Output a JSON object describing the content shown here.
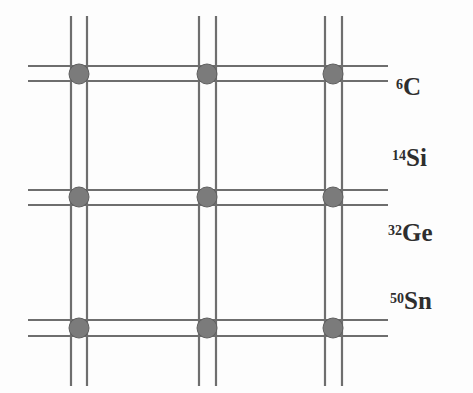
{
  "figure": {
    "background_color": "#fdfdfd"
  },
  "diagram": {
    "type": "lattice-grid",
    "line_color": "#6e6e6e",
    "line_width": 2.2,
    "node_color": "#7b7b7b",
    "node_stroke_color": "#5f5f5f",
    "node_radius": 10,
    "vertical_line_pairs": [
      {
        "name": "column-1",
        "x1": 71,
        "x2": 87
      },
      {
        "name": "column-2",
        "x1": 199,
        "x2": 216
      },
      {
        "name": "column-3",
        "x1": 325,
        "x2": 342
      }
    ],
    "vertical_extent": {
      "y_start": 16,
      "y_end": 386
    },
    "horizontal_line_pairs": [
      {
        "name": "row-1",
        "y1": 66,
        "y2": 81
      },
      {
        "name": "row-2",
        "y1": 190,
        "y2": 205
      },
      {
        "name": "row-3",
        "y1": 320,
        "y2": 336
      }
    ],
    "horizontal_extent": {
      "x_start": 28,
      "x_end": 388
    },
    "nodes": [
      {
        "name": "node-r1c1",
        "cx": 79,
        "cy": 74
      },
      {
        "name": "node-r1c2",
        "cx": 207,
        "cy": 74
      },
      {
        "name": "node-r1c3",
        "cx": 333,
        "cy": 74
      },
      {
        "name": "node-r2c1",
        "cx": 79,
        "cy": 197
      },
      {
        "name": "node-r2c2",
        "cx": 207,
        "cy": 197
      },
      {
        "name": "node-r2c3",
        "cx": 333,
        "cy": 197
      },
      {
        "name": "node-r3c1",
        "cx": 79,
        "cy": 328
      },
      {
        "name": "node-r3c2",
        "cx": 207,
        "cy": 328
      },
      {
        "name": "node-r3c3",
        "cx": 333,
        "cy": 328
      }
    ]
  },
  "labels": {
    "carbon": {
      "mass_number": "6",
      "symbol": "C"
    },
    "silicon": {
      "mass_number": "14",
      "symbol": "Si"
    },
    "germanium": {
      "mass_number": "32",
      "symbol": "Ge"
    },
    "tin": {
      "mass_number": "50",
      "symbol": "Sn"
    }
  }
}
